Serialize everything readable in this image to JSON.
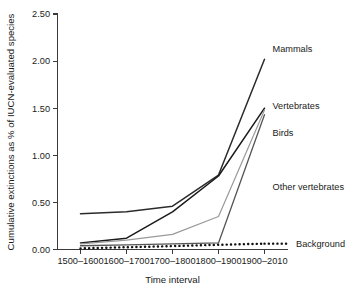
{
  "chart_data": {
    "type": "line",
    "title": "",
    "xlabel": "Time interval",
    "ylabel": "Cumulative extinctions as % of IUCN-evaluated species",
    "categories": [
      "1500–1600",
      "1600–1700",
      "1700–1800",
      "1800–1900",
      "1900–2010"
    ],
    "ylim": [
      0.0,
      2.5
    ],
    "yticks": [
      "0.00",
      "0.50",
      "1.00",
      "1.50",
      "2.00",
      "2.50"
    ],
    "ytick_values": [
      0.0,
      0.5,
      1.0,
      1.5,
      2.0,
      2.5
    ],
    "grid": false,
    "legend_position": "inline-right-of-line-ends",
    "series": [
      {
        "name": "Mammals",
        "label": "Mammals",
        "values": [
          0.38,
          0.4,
          0.46,
          0.79,
          2.02
        ],
        "color": "#2b2b2b",
        "style": "solid",
        "width": 1.5
      },
      {
        "name": "Vertebrates",
        "label": "Vertebrates",
        "values": [
          0.07,
          0.12,
          0.4,
          0.78,
          1.5
        ],
        "color": "#1a1a1a",
        "style": "solid",
        "width": 1.5
      },
      {
        "name": "Birds",
        "label": "Birds",
        "values": [
          0.06,
          0.1,
          0.16,
          0.35,
          1.48
        ],
        "color": "#9a9a9a",
        "style": "solid",
        "width": 1.2
      },
      {
        "name": "Other vertebrates",
        "label": "Other vertebrates",
        "values": [
          0.04,
          0.05,
          0.06,
          0.07,
          1.43
        ],
        "color": "#555555",
        "style": "solid",
        "width": 1.3
      },
      {
        "name": "Background",
        "label": "Background",
        "values": [
          0.012,
          0.024,
          0.036,
          0.05,
          0.062
        ],
        "color": "#111111",
        "style": "dotted",
        "width": 2.4
      }
    ]
  },
  "axes": {
    "x_axis_title": "Time interval",
    "y_axis_title": "Cumulative extinctions as % of IUCN-evaluated species"
  }
}
